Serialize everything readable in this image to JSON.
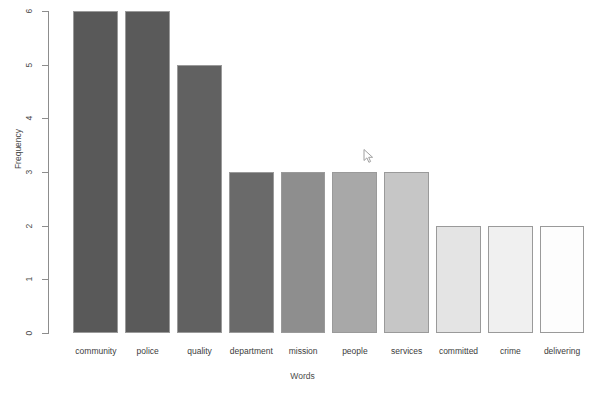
{
  "plot": {
    "clipped_title": "sentiment of words",
    "cursor": {
      "name": "mouse-pointer",
      "x": 366,
      "y": 154
    }
  },
  "chart_data": {
    "type": "bar",
    "title": "",
    "xlabel": "Words",
    "ylabel": "Frequency",
    "categories": [
      "community",
      "police",
      "quality",
      "department",
      "mission",
      "people",
      "services",
      "committed",
      "crime",
      "delivering"
    ],
    "values": [
      6,
      6,
      5,
      3,
      3,
      3,
      3,
      2,
      2,
      2
    ],
    "ylim": [
      0,
      6
    ],
    "ytick_labels": [
      "0",
      "1",
      "2",
      "3",
      "4",
      "5",
      "6"
    ],
    "ytick_values": [
      0,
      1,
      2,
      3,
      4,
      5,
      6
    ],
    "grid": false,
    "legend": null,
    "bar_colors": [
      "#595959",
      "#5a5a5a",
      "#616161",
      "#6a6a6a",
      "#8e8e8e",
      "#a8a8a8",
      "#c6c6c6",
      "#e4e4e4",
      "#f0f0f0",
      "#fdfdfd"
    ],
    "bar_border_color": "#9a9a9a"
  }
}
